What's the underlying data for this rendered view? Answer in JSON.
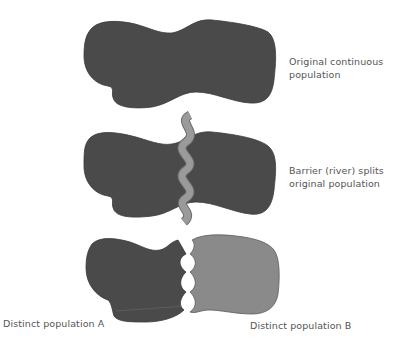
{
  "diagram": {
    "colors": {
      "population_dark": "#4a4a4a",
      "population_b": "#8a8a8a",
      "river": "#9a9a9a",
      "river_edge": "#6a6a6a",
      "label_text": "#555555",
      "background": "#ffffff"
    },
    "stages": [
      {
        "id": "stage-1",
        "label_lines": [
          "Original continuous",
          "population"
        ]
      },
      {
        "id": "stage-2",
        "label_lines": [
          "Barrier (river) splits",
          "original population"
        ]
      },
      {
        "id": "stage-3",
        "population_a_label": "Distinct population A",
        "population_b_label": "Distinct population B"
      }
    ]
  }
}
